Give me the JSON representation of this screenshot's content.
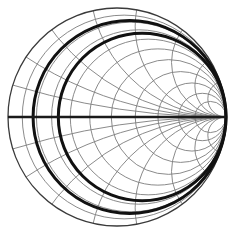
{
  "figure": {
    "kind": "smith-chart",
    "background_color": "#ffffff",
    "grid_color": "#7d7d7d",
    "axis_color": "#1a1a1a",
    "highlight_color": "#111111",
    "outer_circle_color": "#3a3a3a"
  },
  "chart_data": {
    "type": "line",
    "subtitle": "",
    "xlabel": "",
    "ylabel": "",
    "xlim": [
      -1,
      1
    ],
    "ylim": [
      -1,
      1
    ],
    "grid": true,
    "legend_position": "none",
    "geometry": {
      "center_x": 117,
      "center_y": 117,
      "radius": 109,
      "left_point_x": 8,
      "right_point_x": 226,
      "top_point_y": 8,
      "bottom_point_y": 226
    },
    "resistance_circles": {
      "label": "constant resistance circles",
      "values": [
        0.0,
        0.07,
        0.15,
        0.25,
        0.4,
        0.6,
        0.9,
        1.4,
        2.2,
        3.6,
        6.0
      ],
      "stroke": "#7d7d7d",
      "note": "circles tangent to outer boundary at the open-circuit point on the right"
    },
    "reactance_arcs": {
      "label": "constant reactance arcs",
      "values": [
        0.15,
        0.3,
        0.5,
        0.8,
        1.2,
        2.0,
        3.5,
        6.0,
        -0.15,
        -0.3,
        -0.5,
        -0.8,
        -1.2,
        -2.0,
        -3.5,
        -6.0
      ],
      "stroke": "#7d7d7d",
      "note": "arcs converging at the short-circuit point on the left"
    },
    "highlighted_circles": {
      "label": "bold constant resistance circles",
      "values": [
        0.13,
        0.3
      ],
      "stroke": "#111111",
      "stroke_width": 3.0
    },
    "axis": {
      "label": "real axis",
      "from_x": 8,
      "to_x": 226,
      "y": 117,
      "stroke": "#1a1a1a",
      "stroke_width": 2.6
    }
  }
}
